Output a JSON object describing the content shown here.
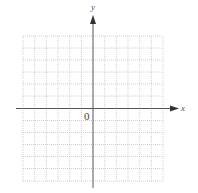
{
  "diagram": {
    "type": "coordinate-plane",
    "x_axis_label": "x",
    "y_axis_label": "y",
    "origin_label": "0",
    "grid": {
      "columns": 12,
      "rows": 12,
      "style": "dotted"
    },
    "colors": {
      "axis": "#555555",
      "grid": "#c8c8c8",
      "background": "#ffffff"
    }
  }
}
